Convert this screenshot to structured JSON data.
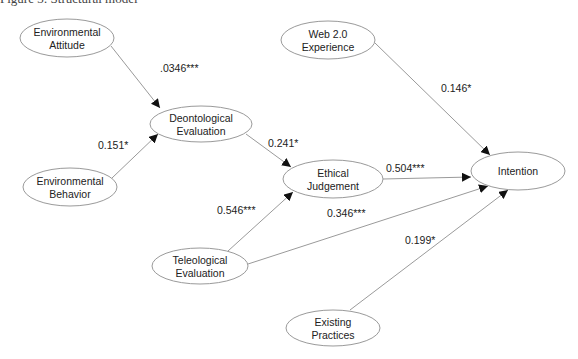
{
  "caption": "Figure 3: Structural model",
  "colors": {
    "stroke": "#9a9a9a",
    "text": "#222222",
    "arrow": "#111111"
  },
  "nodes": [
    {
      "id": "env_att",
      "lines": [
        "Environmental",
        "Attitude"
      ],
      "cx": 67,
      "cy": 38,
      "rx": 47,
      "ry": 19
    },
    {
      "id": "web20",
      "lines": [
        "Web 2.0",
        "Experience"
      ],
      "cx": 328,
      "cy": 40,
      "rx": 47,
      "ry": 19
    },
    {
      "id": "deont",
      "lines": [
        "Deontological",
        "Evaluation"
      ],
      "cx": 201,
      "cy": 124,
      "rx": 51,
      "ry": 18
    },
    {
      "id": "env_beh",
      "lines": [
        "Environmental",
        "Behavior"
      ],
      "cx": 70,
      "cy": 187,
      "rx": 47,
      "ry": 19
    },
    {
      "id": "ethical",
      "lines": [
        "Ethical",
        "Judgement"
      ],
      "cx": 333,
      "cy": 179,
      "rx": 50,
      "ry": 19
    },
    {
      "id": "intention",
      "lines": [
        "Intention"
      ],
      "cx": 518,
      "cy": 171,
      "rx": 47,
      "ry": 19
    },
    {
      "id": "teleo",
      "lines": [
        "Teleological",
        "Evaluation"
      ],
      "cx": 200,
      "cy": 266,
      "rx": 48,
      "ry": 18
    },
    {
      "id": "existing",
      "lines": [
        "Existing",
        "Practices"
      ],
      "cx": 333,
      "cy": 328,
      "rx": 47,
      "ry": 18
    }
  ],
  "edges": [
    {
      "from": "env_att",
      "to": "deont",
      "x1": 111,
      "y1": 46,
      "x2": 160,
      "y2": 108,
      "label": ".0346***",
      "lx": 160,
      "ly": 72
    },
    {
      "from": "env_beh",
      "to": "deont",
      "x1": 112,
      "y1": 178,
      "x2": 158,
      "y2": 134,
      "label": "0.151*",
      "lx": 98,
      "ly": 149
    },
    {
      "from": "deont",
      "to": "ethical",
      "x1": 246,
      "y1": 134,
      "x2": 291,
      "y2": 167,
      "label": "0.241*",
      "lx": 268,
      "ly": 147
    },
    {
      "from": "ethical",
      "to": "intention",
      "x1": 383,
      "y1": 179,
      "x2": 471,
      "y2": 177,
      "label": "0.504***",
      "lx": 386,
      "ly": 172
    },
    {
      "from": "teleo",
      "to": "ethical",
      "x1": 228,
      "y1": 251,
      "x2": 293,
      "y2": 192,
      "label": "0.546***",
      "lx": 217,
      "ly": 214
    },
    {
      "from": "teleo",
      "to": "intention",
      "x1": 248,
      "y1": 264,
      "x2": 488,
      "y2": 186,
      "label": "0.346***",
      "lx": 327,
      "ly": 217
    },
    {
      "from": "existing",
      "to": "intention",
      "x1": 350,
      "y1": 310,
      "x2": 508,
      "y2": 190,
      "label": "0.199*",
      "lx": 405,
      "ly": 244
    },
    {
      "from": "web20",
      "to": "intention",
      "x1": 375,
      "y1": 43,
      "x2": 490,
      "y2": 155,
      "label": "0.146*",
      "lx": 441,
      "ly": 92
    }
  ]
}
